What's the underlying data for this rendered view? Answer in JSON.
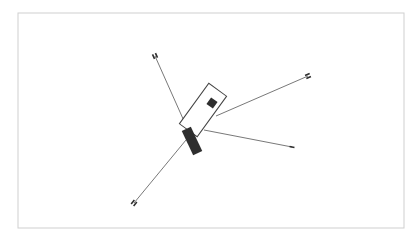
{
  "diagram": {
    "frame": {
      "x": 18,
      "y": 13,
      "width": 386,
      "height": 215,
      "stroke": "#cfcfcf"
    },
    "colors": {
      "line": "#555555",
      "fill": "#2e2e2e",
      "outline": "#444444"
    },
    "central_body": {
      "outline_rect": {
        "cx": 203,
        "cy": 110,
        "width": 22,
        "height": 50,
        "rotate": 36
      },
      "small_square": {
        "cx": 212,
        "cy": 103,
        "size": 8,
        "rotate": 36
      },
      "dark_block": {
        "cx": 192,
        "cy": 141,
        "width": 10,
        "height": 27,
        "rotate": -25
      }
    },
    "arms": [
      {
        "name": "upper-left",
        "x1": 184,
        "y1": 121,
        "x2": 155,
        "y2": 56,
        "marker": "double"
      },
      {
        "name": "upper-right",
        "x1": 216,
        "y1": 116,
        "x2": 308,
        "y2": 76,
        "marker": "double"
      },
      {
        "name": "lower-right",
        "x1": 204,
        "y1": 130,
        "x2": 292,
        "y2": 147,
        "marker": "single"
      },
      {
        "name": "lower-left",
        "x1": 186,
        "y1": 140,
        "x2": 134,
        "y2": 203,
        "marker": "double"
      }
    ]
  }
}
